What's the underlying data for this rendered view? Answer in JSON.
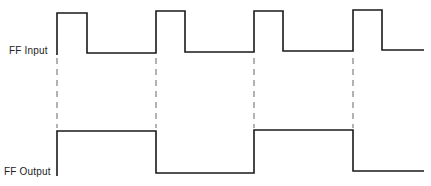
{
  "diagram": {
    "type": "timing-diagram",
    "signals": [
      {
        "name": "FF Input",
        "label": "FF Input",
        "high_y": 12,
        "low_y": 52,
        "points": "57,55 57,13 87,13 87,53 156,53 156,11 185,11 185,52 254,52 254,11 283,11 283,51 353,51 353,10 382,10 382,50 424,50"
      },
      {
        "name": "FF Output",
        "label": "FF Output",
        "high_y": 131,
        "low_y": 173,
        "points": "57,176 57,131 156,131 156,173 254,173 254,130 353,130 353,171 424,171"
      }
    ],
    "clock_edges_x": [
      57,
      156,
      254,
      353
    ],
    "guides": {
      "y_start": 58,
      "y_end": 128
    },
    "colors": {
      "waveform": "#1a1a1a",
      "guide": "#555555",
      "background": "#ffffff"
    }
  }
}
